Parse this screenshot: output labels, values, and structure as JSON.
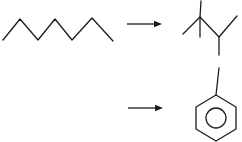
{
  "canvas": {
    "width": 242,
    "height": 142,
    "background_color": "#ffffff",
    "line_color": "#1c1c1c",
    "line_width": 1.3
  },
  "scheme": {
    "molecules": [
      {
        "id": "heptane",
        "name": "heptane-skeletal-structure",
        "role": "reactant",
        "row": 1,
        "polylines": [
          [
            [
              3,
              40
            ],
            [
              20,
              19
            ],
            [
              38,
              40
            ],
            [
              55,
              19
            ],
            [
              72,
              40
            ],
            [
              92,
              18
            ],
            [
              113,
              41
            ]
          ]
        ],
        "circles": []
      },
      {
        "id": "trimethylbutane",
        "name": "2-2-3-trimethylbutane-skeletal-structure",
        "role": "product",
        "row": 1,
        "polylines": [
          [
            [
              183,
              34
            ],
            [
              200,
              17
            ],
            [
              219,
              37
            ],
            [
              237,
              16
            ]
          ],
          [
            [
              200,
              17
            ],
            [
              201,
              1
            ]
          ],
          [
            [
              200,
              17
            ],
            [
              200,
              37
            ]
          ],
          [
            [
              219,
              37
            ],
            [
              219,
              55
            ]
          ]
        ],
        "circles": []
      },
      {
        "id": "toluene",
        "name": "toluene-skeletal-structure",
        "role": "product",
        "row": 2,
        "polylines": [
          [
            [
              216,
              95
            ],
            [
              236,
              107
            ],
            [
              236,
              129
            ],
            [
              216,
              141
            ],
            [
              196,
              129
            ],
            [
              196,
              107
            ],
            [
              216,
              95
            ]
          ],
          [
            [
              216,
              95
            ],
            [
              219,
              68
            ]
          ]
        ],
        "circles": [
          {
            "cx": 216,
            "cy": 118,
            "r": 10
          }
        ]
      }
    ],
    "arrows": [
      {
        "id": "reaction-arrow-1",
        "row": 1,
        "x1": 127,
        "y1": 24,
        "x2": 162,
        "y2": 24,
        "head": "filled-triangle"
      },
      {
        "id": "reaction-arrow-2",
        "row": 2,
        "x1": 128,
        "y1": 108,
        "x2": 163,
        "y2": 108,
        "head": "filled-triangle"
      }
    ]
  }
}
